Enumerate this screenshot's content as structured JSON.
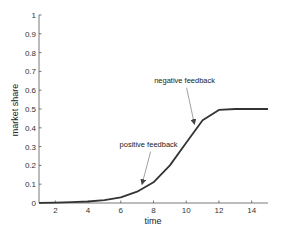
{
  "chart_data": {
    "type": "line",
    "title": "",
    "xlabel": "time",
    "ylabel": "market share",
    "xlim": [
      1,
      15
    ],
    "ylim": [
      0,
      1
    ],
    "grid": false,
    "legend": null,
    "x_ticks": [
      2,
      4,
      6,
      8,
      10,
      12,
      14
    ],
    "y_ticks": [
      0,
      0.1,
      0.2,
      0.3,
      0.4,
      0.5,
      0.6,
      0.7,
      0.8,
      0.9,
      1
    ],
    "y_tick_labels": [
      "0",
      "0.1",
      "0.2",
      "0.3",
      "0.4",
      "0.5",
      "0.6",
      "0.7",
      "0.8",
      "0.9",
      "1"
    ],
    "series": [
      {
        "name": "market share",
        "color": "#333333",
        "x": [
          1,
          2,
          3,
          4,
          5,
          6,
          7,
          8,
          9,
          10,
          11,
          12,
          13,
          14,
          15
        ],
        "values": [
          0.001,
          0.002,
          0.004,
          0.008,
          0.015,
          0.03,
          0.06,
          0.11,
          0.2,
          0.32,
          0.44,
          0.495,
          0.5,
          0.5,
          0.5
        ]
      }
    ],
    "annotations": [
      {
        "text": "positive feedback",
        "text_x": 7.7,
        "text_y": 0.3,
        "arrow_to_x": 7.3,
        "arrow_to_y": 0.1
      },
      {
        "text": "negative feedback",
        "text_x": 9.9,
        "text_y": 0.64,
        "arrow_to_x": 10.5,
        "arrow_to_y": 0.42
      }
    ]
  }
}
